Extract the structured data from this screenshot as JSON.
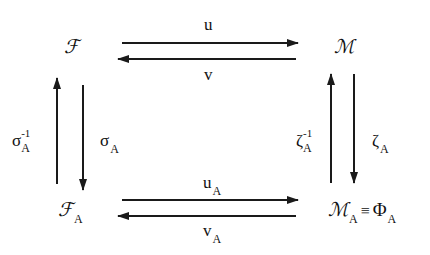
{
  "diagram": {
    "type": "commutative-diagram",
    "nodes": {
      "top_left": {
        "main": "ℱ",
        "sub": ""
      },
      "top_right": {
        "main": "ℳ",
        "sub": ""
      },
      "bottom_left": {
        "main": "ℱ",
        "sub": "A"
      },
      "bottom_right": {
        "main": "ℳ",
        "sub": "A",
        "relation": "≡",
        "equiv_main": "Φ",
        "equiv_sub": "A"
      }
    },
    "edges": {
      "top_forward": {
        "label": "u",
        "sub": "",
        "from": "ℱ",
        "to": "ℳ"
      },
      "top_backward": {
        "label": "v",
        "sub": "",
        "from": "ℳ",
        "to": "ℱ"
      },
      "bottom_forward": {
        "label": "u",
        "sub": "A",
        "from": "ℱ_A",
        "to": "ℳ_A"
      },
      "bottom_backward": {
        "label": "v",
        "sub": "A",
        "from": "ℳ_A",
        "to": "ℱ_A"
      },
      "left_up": {
        "label": "σ",
        "sup": "-1",
        "sub": "A",
        "from": "ℱ_A",
        "to": "ℱ"
      },
      "left_down": {
        "label": "σ",
        "sub": "A",
        "from": "ℱ",
        "to": "ℱ_A"
      },
      "right_up": {
        "label": "ζ",
        "sup": "-1",
        "sub": "A",
        "from": "ℳ_A",
        "to": "ℳ"
      },
      "right_down": {
        "label": "ζ",
        "sub": "A",
        "from": "ℳ",
        "to": "ℳ_A"
      }
    },
    "colors": {
      "stroke": "#1a1a1a",
      "background": "#ffffff"
    }
  }
}
